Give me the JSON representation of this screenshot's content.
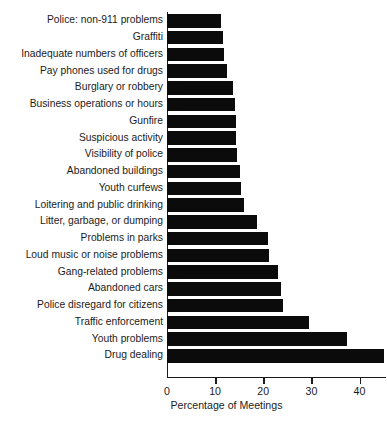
{
  "chart_data": {
    "type": "bar",
    "orientation": "horizontal",
    "title": "",
    "xlabel": "Percentage of Meetings",
    "ylabel": "",
    "xlim": [
      0,
      45.5
    ],
    "xticks": [
      0,
      10,
      20,
      30,
      40
    ],
    "grid": false,
    "legend": null,
    "bar_color": "#0b0b0b",
    "axis_color": "#1a1a1a",
    "categories": [
      "Police: non-911 problems",
      "Graffiti",
      "Inadequate numbers of officers",
      "Pay phones used for drugs",
      "Burglary or robbery",
      "Business operations or hours",
      "Gunfire",
      "Suspicious activity",
      "Visibility of police",
      "Abandoned buildings",
      "Youth curfews",
      "Loitering and public drinking",
      "Litter, garbage, or dumping",
      "Problems in parks",
      "Loud music or noise problems",
      "Gang-related problems",
      "Abandoned cars",
      "Police disregard for citizens",
      "Traffic enforcement",
      "Youth problems",
      "Drug dealing"
    ],
    "values": [
      11.2,
      11.7,
      11.8,
      12.4,
      13.8,
      14.2,
      14.4,
      14.4,
      14.6,
      15.2,
      15.4,
      16.1,
      18.7,
      20.9,
      21.2,
      23.1,
      23.7,
      24.0,
      29.4,
      37.4,
      45.0
    ]
  }
}
